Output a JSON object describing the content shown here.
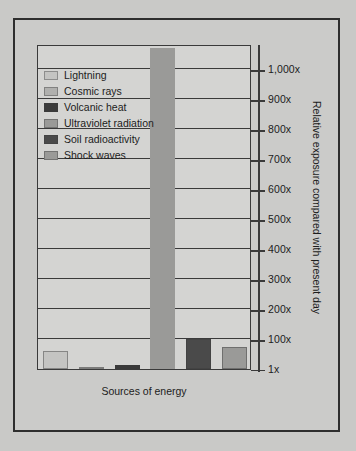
{
  "chart_data": {
    "type": "bar",
    "title": "",
    "xlabel": "Sources of energy",
    "ylabel": "Relative exposure compared with present day",
    "categories": [
      "Lightning",
      "Cosmic rays",
      "Volcanic heat",
      "Ultraviolet radiation",
      "Soil radioactivity",
      "Shock waves"
    ],
    "values": [
      60,
      5,
      12,
      1070,
      100,
      75
    ],
    "value_suffix": "x",
    "ylim": [
      1,
      1100
    ],
    "yticks": [
      1,
      100,
      200,
      300,
      400,
      500,
      600,
      700,
      800,
      900,
      1000
    ],
    "ytick_labels": [
      "1x",
      "100x",
      "200x",
      "300x",
      "400x",
      "500x",
      "600x",
      "700x",
      "800x",
      "900x",
      "1,000x"
    ],
    "grid": true,
    "legend_position": "upper-left-inside",
    "series": [
      {
        "name": "Lightning",
        "value": 60,
        "color": "#c4c4c2"
      },
      {
        "name": "Cosmic rays",
        "value": 5,
        "color": "#b0b0ae"
      },
      {
        "name": "Volcanic heat",
        "value": 12,
        "color": "#3a3a3a"
      },
      {
        "name": "Ultraviolet radiation",
        "value": 1070,
        "color": "#9a9a98"
      },
      {
        "name": "Soil radioactivity",
        "value": 100,
        "color": "#4a4a4a"
      },
      {
        "name": "Shock waves",
        "value": 75,
        "color": "#9a9a98"
      }
    ]
  },
  "legend": {
    "items": [
      {
        "label": "Lightning",
        "color": "#c4c4c2"
      },
      {
        "label": "Cosmic rays",
        "color": "#b0b0ae"
      },
      {
        "label": "Volcanic heat",
        "color": "#3a3a3a"
      },
      {
        "label": "Ultraviolet radiation",
        "color": "#9a9a98"
      },
      {
        "label": "Soil radioactivity",
        "color": "#4a4a4a"
      },
      {
        "label": "Shock waves",
        "color": "#9a9a98"
      }
    ]
  },
  "colors": {
    "page_background": "#c9c9c7",
    "plot_background": "#d4d4d2",
    "frame": "#2e2e2e",
    "axis": "#3a3a3a",
    "text": "#1c1c1c"
  }
}
